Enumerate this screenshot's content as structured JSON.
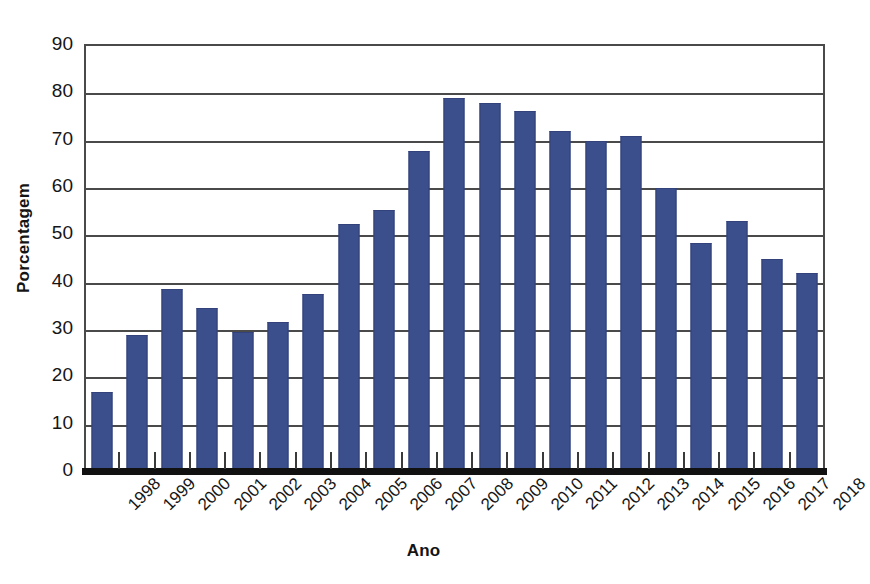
{
  "chart_data": {
    "type": "bar",
    "title": "",
    "xlabel": "Ano",
    "ylabel": "Porcentagem",
    "categories": [
      "1998",
      "1999",
      "2000",
      "2001",
      "2002",
      "2003",
      "2004",
      "2005",
      "2006",
      "2007",
      "2008",
      "2009",
      "2010",
      "2011",
      "2012",
      "2013",
      "2014",
      "2015",
      "2016",
      "2017",
      "2018"
    ],
    "values": [
      16.5,
      28.5,
      38.2,
      34.3,
      29.2,
      31.2,
      37.2,
      52.0,
      55.0,
      67.5,
      78.6,
      77.5,
      75.8,
      71.6,
      69.6,
      70.5,
      59.6,
      47.9,
      52.6,
      44.6,
      41.6
    ],
    "ylim": [
      0,
      90
    ],
    "yticks": [
      0,
      10,
      20,
      30,
      40,
      50,
      60,
      70,
      80,
      90
    ],
    "ytick_labels": [
      "0",
      "10",
      "20",
      "30",
      "40",
      "50",
      "60",
      "70",
      "80",
      "90"
    ],
    "grid": "horizontal",
    "legend": "none",
    "bar_color": "#3c4f8d",
    "axis_color": "#4a4a4a",
    "baseline_color": "#111111",
    "background_color": "#ffffff"
  }
}
